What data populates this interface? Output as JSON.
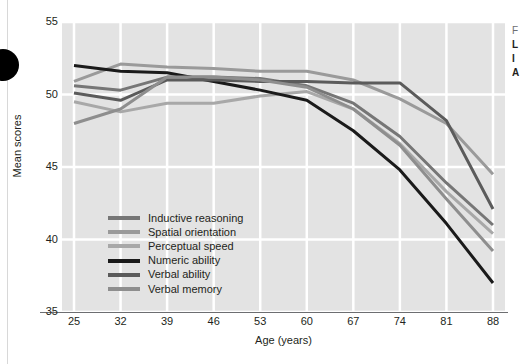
{
  "chart_data": {
    "type": "line",
    "title": "",
    "xlabel": "Age (years)",
    "ylabel": "Mean scores",
    "xlim": [
      25,
      88
    ],
    "ylim": [
      35,
      55
    ],
    "grid": true,
    "legend_position": "inside-lower-left",
    "x": [
      25,
      32,
      39,
      46,
      53,
      60,
      67,
      74,
      81,
      88
    ],
    "xticks": [
      "25",
      "32",
      "39",
      "46",
      "53",
      "60",
      "67",
      "74",
      "81",
      "88"
    ],
    "yticks": [
      "35",
      "40",
      "45",
      "50",
      "55"
    ],
    "series": [
      {
        "name": "Inductive reasoning",
        "color": "#767676",
        "values": [
          50.6,
          50.3,
          51.2,
          51.2,
          51.1,
          50.6,
          49.4,
          47.1,
          43.9,
          41.0
        ]
      },
      {
        "name": "Spatial orientation",
        "color": "#9a9a9a",
        "values": [
          50.9,
          52.1,
          51.9,
          51.8,
          51.6,
          51.6,
          51.0,
          49.7,
          48.0,
          44.5
        ]
      },
      {
        "name": "Perceptual speed",
        "color": "#a8a8a8",
        "values": [
          49.5,
          48.8,
          49.4,
          49.4,
          49.9,
          50.2,
          49.0,
          46.6,
          43.3,
          40.4
        ]
      },
      {
        "name": "Numeric ability",
        "color": "#1a1a1a",
        "values": [
          52.0,
          51.6,
          51.5,
          50.9,
          50.3,
          49.6,
          47.5,
          44.8,
          41.1,
          37.0
        ]
      },
      {
        "name": "Verbal ability",
        "color": "#5b5b5b",
        "values": [
          50.1,
          49.6,
          51.0,
          51.0,
          50.9,
          50.9,
          50.8,
          50.8,
          48.2,
          42.1
        ]
      },
      {
        "name": "Verbal memory",
        "color": "#8e8e8e",
        "values": [
          48.0,
          49.0,
          51.2,
          51.2,
          51.0,
          50.5,
          49.0,
          46.5,
          42.8,
          39.2
        ]
      }
    ]
  },
  "axes": {
    "x_title": "Age (years)",
    "y_title": "Mean scores"
  },
  "legend": {
    "items": [
      {
        "label": "Inductive reasoning",
        "color": "#767676"
      },
      {
        "label": "Spatial orientation",
        "color": "#9a9a9a"
      },
      {
        "label": "Perceptual speed",
        "color": "#a8a8a8"
      },
      {
        "label": "Numeric ability",
        "color": "#1a1a1a"
      },
      {
        "label": "Verbal ability",
        "color": "#5b5b5b"
      },
      {
        "label": "Verbal memory",
        "color": "#8e8e8e"
      }
    ]
  },
  "margin_note": {
    "lines": [
      "F",
      "L",
      "I",
      "A"
    ]
  },
  "colors": {
    "plot_background": "#e3e3e3",
    "gridline": "#ffffff",
    "axis_line": "#6d6e71",
    "text": "#231f20"
  }
}
